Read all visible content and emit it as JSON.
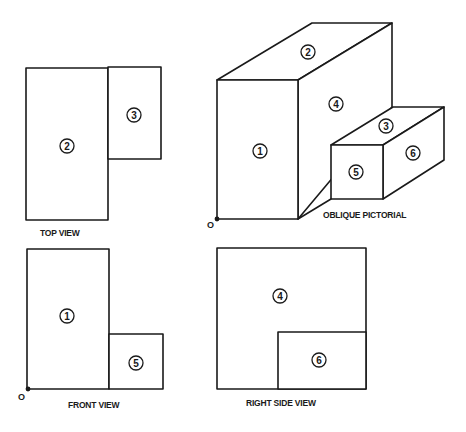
{
  "diagram": {
    "type": "orthographic-projection",
    "views": {
      "top": {
        "label": "TOP VIEW",
        "faces": [
          {
            "id": "2",
            "label": "2"
          },
          {
            "id": "3",
            "label": "3"
          }
        ]
      },
      "oblique": {
        "label": "OBLIQUE PICTORIAL",
        "origin_label": "O",
        "faces": [
          {
            "id": "1",
            "label": "1"
          },
          {
            "id": "2",
            "label": "2"
          },
          {
            "id": "3",
            "label": "3"
          },
          {
            "id": "4",
            "label": "4"
          },
          {
            "id": "5",
            "label": "5"
          },
          {
            "id": "6",
            "label": "6"
          }
        ]
      },
      "front": {
        "label": "FRONT VIEW",
        "origin_label": "O",
        "faces": [
          {
            "id": "1",
            "label": "1"
          },
          {
            "id": "5",
            "label": "5"
          }
        ]
      },
      "right_side": {
        "label": "RIGHT SIDE VIEW",
        "faces": [
          {
            "id": "4",
            "label": "4"
          },
          {
            "id": "6",
            "label": "6"
          }
        ]
      }
    },
    "colors": {
      "line": "#1a1a1a",
      "background": "#ffffff"
    }
  }
}
